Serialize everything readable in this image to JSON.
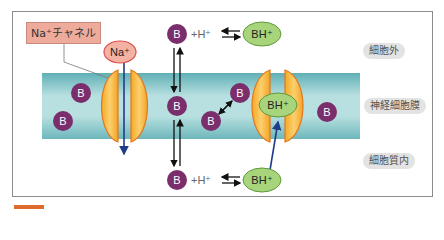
{
  "diagram": {
    "channel_label": "Na⁺チャネル",
    "na_ion": "Na⁺",
    "molecule_b": "B",
    "proton_term": "+H⁺",
    "protonated": "BH⁺",
    "regions": {
      "extracellular": "細胞外",
      "membrane": "神経細胞膜",
      "intracellular": "細胞質内"
    },
    "colors": {
      "membrane_teal": "#7cc3c8",
      "channel_orange": "#f5b53a",
      "channel_outline": "#e0781f",
      "molecule_purple": "#7a2e6c",
      "protonated_green": "#a8d47c",
      "na_pink": "#f3b2a4",
      "arrow_blue": "#1f3c88",
      "accent_orange": "#e06a2e"
    }
  }
}
